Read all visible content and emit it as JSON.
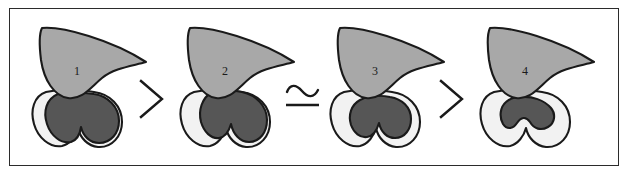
{
  "figure": {
    "type": "comparison-series-diagram",
    "border_color": "#2b2b2b",
    "background_color": "#ffffff",
    "outline_color": "#1a1a1a",
    "wing_fill": "#a8a8a8",
    "rim_fill": "#f2f2f2",
    "core_fill": "#565656",
    "panel_count": 4,
    "operator_count": 3,
    "reading": "1 > 2 ≃ 3 > 4"
  },
  "panels": [
    {
      "id": "panel-1",
      "label": "1",
      "label_x": 74,
      "label_y": 65,
      "left": 28,
      "core_size": "largest",
      "rim_extent": "thin crescent on left side only"
    },
    {
      "id": "panel-2",
      "label": "2",
      "label_x": 222,
      "label_y": 65,
      "left": 176,
      "core_size": "large",
      "rim_extent": "crescent on left widening toward lower lobe"
    },
    {
      "id": "panel-3",
      "label": "3",
      "label_x": 372,
      "label_y": 65,
      "left": 326,
      "core_size": "reduced",
      "rim_extent": "continuous ring around core"
    },
    {
      "id": "panel-4",
      "label": "4",
      "label_x": 522,
      "label_y": 65,
      "left": 476,
      "core_size": "smallest",
      "rim_extent": "broad ring, core reduced to narrow band"
    }
  ],
  "operators": [
    {
      "id": "operator-1",
      "symbol": "greater-than",
      "glyph": ">",
      "left": 131,
      "between": "1 and 2"
    },
    {
      "id": "operator-2",
      "symbol": "asymptotically-equal",
      "glyph": "≃",
      "left": 281,
      "between": "2 and 3"
    },
    {
      "id": "operator-3",
      "symbol": "greater-than",
      "glyph": ">",
      "left": 431,
      "between": "3 and 4"
    }
  ]
}
